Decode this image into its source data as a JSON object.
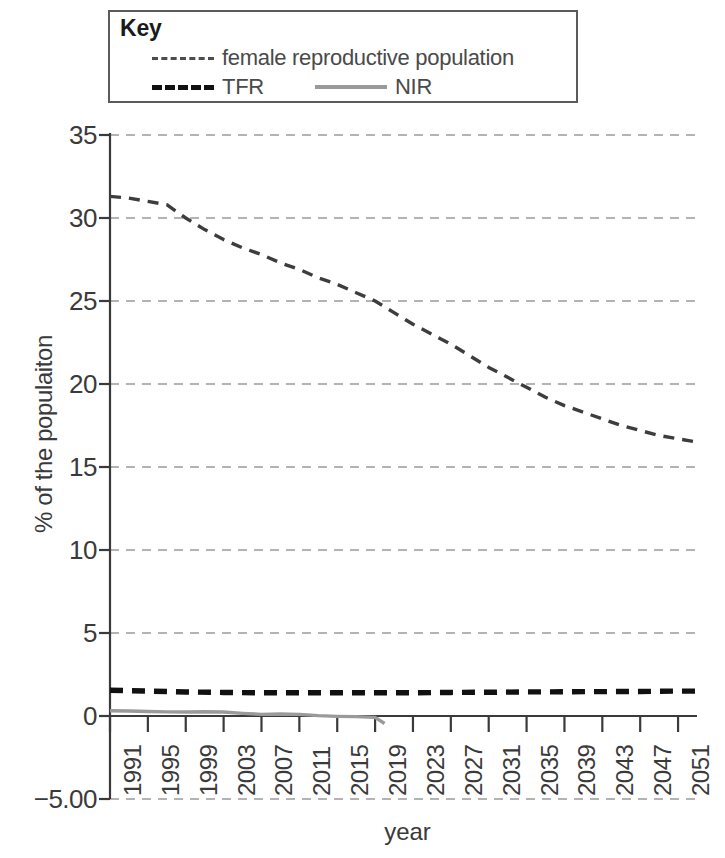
{
  "legend": {
    "title": "Key",
    "entries": [
      {
        "label": "female reproductive population",
        "style": "dashed-thin",
        "color": "#4d4d4d"
      },
      {
        "label": "TFR",
        "style": "dashed-thick",
        "color": "#111111"
      },
      {
        "label": "NIR",
        "style": "solid",
        "color": "#9a9a9a"
      }
    ]
  },
  "axes": {
    "y_title": "% of the populaiton",
    "x_title": "year"
  },
  "chart_data": {
    "type": "line",
    "title": "",
    "xlabel": "year",
    "ylabel": "% of the populaiton",
    "xlim": [
      1991,
      2053
    ],
    "ylim": [
      -5.0,
      35.0
    ],
    "grid": true,
    "legend_position": "top",
    "y_ticks": [
      "35",
      "30",
      "25",
      "20",
      "15",
      "10",
      "5",
      "0",
      "-5.00"
    ],
    "y_tick_values": [
      35,
      30,
      25,
      20,
      15,
      10,
      5,
      0,
      -5
    ],
    "x_ticks": [
      "1991",
      "1995",
      "1999",
      "2003",
      "2007",
      "2011",
      "2015",
      "2019",
      "2023",
      "2027",
      "2031",
      "2035",
      "2039",
      "2043",
      "2047",
      "2051"
    ],
    "x_tick_values": [
      1991,
      1995,
      1999,
      2003,
      2007,
      2011,
      2015,
      2019,
      2023,
      2027,
      2031,
      2035,
      2039,
      2043,
      2047,
      2051
    ],
    "series": [
      {
        "name": "female reproductive population",
        "style": "dashed-thin",
        "color": "#3d3d3d",
        "x": [
          1991,
          1993,
          1995,
          1997,
          1999,
          2001,
          2003,
          2005,
          2007,
          2009,
          2011,
          2013,
          2015,
          2017,
          2019,
          2021,
          2023,
          2025,
          2027,
          2029,
          2031,
          2033,
          2035,
          2037,
          2039,
          2041,
          2043,
          2045,
          2047,
          2049,
          2051,
          2053
        ],
        "values": [
          31.3,
          31.2,
          31.0,
          30.8,
          30.0,
          29.3,
          28.7,
          28.2,
          27.8,
          27.3,
          26.9,
          26.4,
          26.0,
          25.5,
          25.0,
          24.3,
          23.6,
          23.0,
          22.4,
          21.7,
          21.0,
          20.4,
          19.8,
          19.2,
          18.7,
          18.3,
          17.9,
          17.5,
          17.2,
          16.9,
          16.7,
          16.5
        ]
      },
      {
        "name": "TFR",
        "style": "dashed-thick",
        "color": "#111111",
        "x": [
          1991,
          1995,
          1999,
          2003,
          2007,
          2011,
          2015,
          2019,
          2023,
          2027,
          2031,
          2035,
          2039,
          2043,
          2047,
          2051,
          2053
        ],
        "values": [
          1.55,
          1.5,
          1.45,
          1.42,
          1.4,
          1.4,
          1.4,
          1.4,
          1.4,
          1.42,
          1.43,
          1.45,
          1.46,
          1.47,
          1.48,
          1.5,
          1.5
        ]
      },
      {
        "name": "NIR",
        "style": "solid",
        "color": "#9a9a9a",
        "x": [
          1991,
          1993,
          1995,
          1997,
          1999,
          2001,
          2003,
          2005,
          2007,
          2009,
          2011,
          2013,
          2015,
          2017,
          2019,
          2020
        ],
        "values": [
          0.32,
          0.3,
          0.27,
          0.25,
          0.24,
          0.26,
          0.24,
          0.16,
          0.1,
          0.12,
          0.1,
          0.02,
          -0.02,
          -0.04,
          -0.08,
          -0.45
        ]
      }
    ]
  }
}
